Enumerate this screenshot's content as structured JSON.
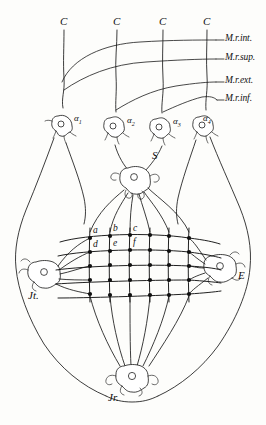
{
  "figure": {
    "ink_color": "#1a1a1a",
    "background_color": "#fdfdfb"
  },
  "nerve_roots": {
    "label_text": "C",
    "items": [
      {
        "id": "c1",
        "label": "C"
      },
      {
        "id": "c2",
        "label": "C"
      },
      {
        "id": "c3",
        "label": "C"
      },
      {
        "id": "c4",
        "label": "C"
      }
    ]
  },
  "muscles": {
    "items": [
      {
        "id": "m-int",
        "label": "M.r.int."
      },
      {
        "id": "m-sup",
        "label": "M.r.sup."
      },
      {
        "id": "m-ext",
        "label": "M.r.ext."
      },
      {
        "id": "m-inf",
        "label": "M.r.inf."
      }
    ]
  },
  "ganglion_cells": {
    "items": [
      {
        "id": "a1",
        "symbol": "α",
        "subscript": "1"
      },
      {
        "id": "a2",
        "symbol": "α",
        "subscript": "2"
      },
      {
        "id": "a3",
        "symbol": "α",
        "subscript": "3"
      },
      {
        "id": "a4",
        "symbol": "α",
        "subscript": "4"
      }
    ]
  },
  "retinal_nodes": {
    "superior": {
      "id": "node-s",
      "label": "S"
    },
    "left": {
      "id": "node-jl",
      "label": "Jt."
    },
    "right": {
      "id": "node-e",
      "label": "E"
    },
    "inferior": {
      "id": "node-jr",
      "label": "Jr."
    }
  },
  "grid": {
    "rows": 5,
    "columns": 6,
    "point_labels": [
      {
        "id": "pt-a",
        "label": "a"
      },
      {
        "id": "pt-b",
        "label": "b"
      },
      {
        "id": "pt-c",
        "label": "c"
      },
      {
        "id": "pt-d",
        "label": "d"
      },
      {
        "id": "pt-e",
        "label": "e"
      },
      {
        "id": "pt-f",
        "label": "f"
      }
    ]
  }
}
